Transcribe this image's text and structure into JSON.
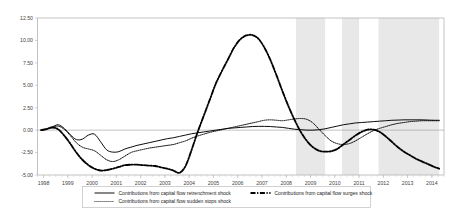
{
  "chart": {
    "title": "",
    "subtitle": "",
    "xlabel": "",
    "ylabel": ""
  },
  "legend": {
    "items": [
      {
        "key": "retrenchment",
        "label": "Contributions from capital flow retrenchment shock",
        "style": "solid"
      },
      {
        "key": "surges",
        "label": "Contributions from capital flow surges shock",
        "style": "dash-dot"
      },
      {
        "key": "sudden_stops",
        "label": "Contributions from capital flow sudden stops shock",
        "style": "dotted"
      }
    ]
  },
  "axis": {
    "y_ticks": [
      "12.50",
      "10.00",
      "7.50",
      "5.00",
      "2.50",
      "0.00",
      "-2.50",
      "-5.00"
    ],
    "x_ticks": [
      "1998",
      "1999",
      "2000",
      "2001",
      "2002",
      "2003",
      "2004",
      "2005",
      "2006",
      "2007",
      "2008",
      "2009",
      "2010",
      "2011",
      "2012",
      "2013",
      "2014"
    ]
  },
  "chart_data": {
    "type": "line",
    "title": "",
    "xlabel": "",
    "ylabel": "",
    "ylim": [
      -5.0,
      12.5
    ],
    "xlim": [
      1997.75,
      2014.5
    ],
    "grid": false,
    "legend_position": "bottom",
    "y_ticks": [
      12.5,
      10.0,
      7.5,
      5.0,
      2.5,
      0.0,
      -2.5,
      -5.0
    ],
    "x_ticks": [
      1998,
      1999,
      2000,
      2001,
      2002,
      2003,
      2004,
      2005,
      2006,
      2007,
      2008,
      2009,
      2010,
      2011,
      2012,
      2013,
      2014
    ],
    "shaded_bands": [
      {
        "start": 2008.4,
        "end": 2009.6,
        "color": "#e8e8e8"
      },
      {
        "start": 2010.3,
        "end": 2011.0,
        "color": "#e8e8e8"
      },
      {
        "start": 2011.8,
        "end": 2014.3,
        "color": "#e8e8e8"
      }
    ],
    "series": [
      {
        "name": "Contributions from capital flow retrenchment shock",
        "style": "solid",
        "color": "#000000",
        "x": [
          1997.9,
          1998.1,
          1998.35,
          1998.6,
          1998.85,
          1999.1,
          1999.35,
          1999.6,
          1999.85,
          2000.1,
          2000.35,
          2000.6,
          2000.85,
          2001.1,
          2001.35,
          2001.6,
          2001.85,
          2002.1,
          2002.35,
          2002.6,
          2002.85,
          2003.1,
          2003.35,
          2003.6,
          2003.85,
          2004.1,
          2004.35,
          2004.6,
          2004.85,
          2005.1,
          2005.35,
          2005.6,
          2005.85,
          2006.1,
          2006.35,
          2006.6,
          2006.85,
          2007.1,
          2007.35,
          2007.6,
          2007.85,
          2008.1,
          2008.35,
          2008.6,
          2008.85,
          2009.1,
          2009.35,
          2009.6,
          2009.85,
          2010.1,
          2010.35,
          2010.6,
          2010.85,
          2011.1,
          2011.35,
          2011.6,
          2011.85,
          2012.1,
          2012.35,
          2012.6,
          2012.85,
          2013.1,
          2013.35,
          2013.6,
          2013.85,
          2014.1,
          2014.3
        ],
        "y": [
          0.0,
          0.1,
          0.35,
          0.6,
          0.2,
          -0.5,
          -1.05,
          -1.0,
          -0.55,
          -0.45,
          -1.3,
          -2.2,
          -2.45,
          -2.4,
          -2.1,
          -1.9,
          -1.7,
          -1.55,
          -1.4,
          -1.25,
          -1.1,
          -0.95,
          -0.85,
          -0.7,
          -0.55,
          -0.4,
          -0.3,
          -0.2,
          -0.1,
          0.0,
          0.1,
          0.2,
          0.25,
          0.3,
          0.35,
          0.4,
          0.42,
          0.42,
          0.4,
          0.35,
          0.3,
          0.2,
          0.1,
          0.05,
          0.0,
          0.0,
          0.05,
          0.15,
          0.3,
          0.45,
          0.6,
          0.7,
          0.8,
          0.85,
          0.9,
          0.95,
          1.0,
          1.05,
          1.1,
          1.12,
          1.15,
          1.15,
          1.15,
          1.15,
          1.12,
          1.1,
          1.1
        ]
      },
      {
        "name": "Contributions from capital flow surges shock",
        "style": "dash-dot",
        "color": "#000000",
        "x": [
          1997.9,
          1998.1,
          1998.35,
          1998.6,
          1998.85,
          1999.1,
          1999.35,
          1999.6,
          1999.85,
          2000.1,
          2000.35,
          2000.6,
          2000.85,
          2001.1,
          2001.35,
          2001.6,
          2001.85,
          2002.1,
          2002.35,
          2002.6,
          2002.85,
          2003.1,
          2003.35,
          2003.6,
          2003.85,
          2004.1,
          2004.35,
          2004.6,
          2004.85,
          2005.1,
          2005.35,
          2005.6,
          2005.85,
          2006.1,
          2006.35,
          2006.6,
          2006.85,
          2007.1,
          2007.35,
          2007.6,
          2007.85,
          2008.1,
          2008.35,
          2008.6,
          2008.85,
          2009.1,
          2009.35,
          2009.6,
          2009.85,
          2010.1,
          2010.35,
          2010.6,
          2010.85,
          2011.1,
          2011.35,
          2011.6,
          2011.85,
          2012.1,
          2012.35,
          2012.6,
          2012.85,
          2013.1,
          2013.35,
          2013.6,
          2013.85,
          2014.1,
          2014.3
        ],
        "y": [
          0.0,
          0.1,
          0.3,
          0.1,
          -0.6,
          -1.5,
          -2.5,
          -3.3,
          -3.9,
          -4.3,
          -4.5,
          -4.45,
          -4.3,
          -4.1,
          -3.9,
          -3.85,
          -3.85,
          -3.9,
          -3.95,
          -4.0,
          -4.15,
          -4.3,
          -4.5,
          -4.75,
          -4.0,
          -2.2,
          -0.2,
          1.6,
          3.4,
          5.2,
          6.6,
          7.9,
          9.2,
          10.1,
          10.55,
          10.6,
          10.2,
          9.2,
          7.8,
          6.1,
          4.3,
          2.6,
          1.1,
          -0.2,
          -1.2,
          -1.9,
          -2.3,
          -2.4,
          -2.35,
          -2.1,
          -1.6,
          -1.1,
          -0.6,
          -0.2,
          0.05,
          0.05,
          -0.2,
          -0.7,
          -1.3,
          -1.9,
          -2.4,
          -2.8,
          -3.2,
          -3.5,
          -3.8,
          -4.1,
          -4.3
        ]
      },
      {
        "name": "Contributions from capital flow sudden stops shock",
        "style": "dotted",
        "color": "#000000",
        "x": [
          1997.9,
          1998.1,
          1998.35,
          1998.6,
          1998.85,
          1999.1,
          1999.35,
          1999.6,
          1999.85,
          2000.1,
          2000.35,
          2000.6,
          2000.85,
          2001.1,
          2001.35,
          2001.6,
          2001.85,
          2002.1,
          2002.35,
          2002.6,
          2002.85,
          2003.1,
          2003.35,
          2003.6,
          2003.85,
          2004.1,
          2004.35,
          2004.6,
          2004.85,
          2005.1,
          2005.35,
          2005.6,
          2005.85,
          2006.1,
          2006.35,
          2006.6,
          2006.85,
          2007.1,
          2007.35,
          2007.6,
          2007.85,
          2008.1,
          2008.35,
          2008.6,
          2008.85,
          2009.1,
          2009.35,
          2009.6,
          2009.85,
          2010.1,
          2010.35,
          2010.6,
          2010.85,
          2011.1,
          2011.35,
          2011.6,
          2011.85,
          2012.1,
          2012.35,
          2012.6,
          2012.85,
          2013.1,
          2013.35,
          2013.6,
          2013.85,
          2014.1,
          2014.3
        ],
        "y": [
          0.0,
          0.1,
          0.3,
          0.45,
          0.1,
          -0.6,
          -1.4,
          -1.9,
          -2.1,
          -2.3,
          -2.8,
          -3.3,
          -3.5,
          -3.3,
          -2.9,
          -2.5,
          -2.3,
          -2.15,
          -2.0,
          -1.9,
          -1.8,
          -1.7,
          -1.6,
          -1.4,
          -1.2,
          -0.9,
          -0.65,
          -0.45,
          -0.25,
          -0.1,
          0.05,
          0.2,
          0.35,
          0.5,
          0.65,
          0.8,
          0.95,
          1.1,
          1.15,
          1.1,
          1.05,
          1.15,
          1.25,
          1.3,
          1.2,
          0.8,
          0.1,
          -0.6,
          -1.2,
          -1.5,
          -1.6,
          -1.5,
          -1.2,
          -0.8,
          -0.4,
          -0.05,
          0.2,
          0.4,
          0.6,
          0.75,
          0.85,
          0.95,
          1.0,
          1.05,
          1.05,
          1.05,
          1.05
        ]
      }
    ]
  }
}
